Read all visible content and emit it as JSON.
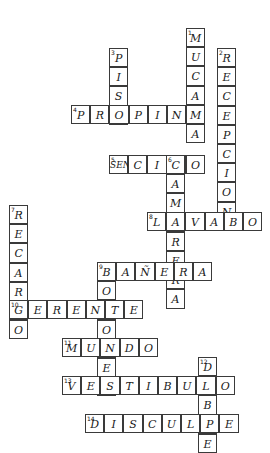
{
  "puzzle": {
    "type": "crossword",
    "title": "Crucigrama",
    "language": "es",
    "grid": {
      "cell_size": 19.2,
      "origin_x": 5,
      "origin_y": 28,
      "columns": 13,
      "rows": 21,
      "background": "#ffffff",
      "line_color": "#3a3a3a",
      "ink_color": "#1a1a1a"
    },
    "entries": [
      {
        "number": "1",
        "answer": "MUCAMA",
        "direction": "down",
        "col": 9,
        "row": 0,
        "length": 6
      },
      {
        "number": "2",
        "answer": "RECEPCION",
        "direction": "down",
        "col": 11,
        "row": 1,
        "length": 9
      },
      {
        "number": "3",
        "answer": "PISO",
        "direction": "down",
        "col": 5,
        "row": 2,
        "length": 4
      },
      {
        "number": "4",
        "answer": "PROPINA",
        "direction": "across",
        "col": 3,
        "row": 5,
        "length": 7
      },
      {
        "number": "5",
        "answer": "SENCILLO",
        "direction": "across",
        "col": 5,
        "row": 8,
        "length": 7
      },
      {
        "number": "6",
        "answer": "CAMARERA",
        "direction": "down",
        "col": 8,
        "row": 8,
        "length": 8
      },
      {
        "number": "7",
        "answer": "RECARGO",
        "direction": "down",
        "col": 0,
        "row": 11,
        "length": 7
      },
      {
        "number": "8",
        "answer": "LAVABO",
        "direction": "across",
        "col": 7,
        "row": 11,
        "length": 6
      },
      {
        "number": "9",
        "answer": "BOTONES",
        "direction": "down",
        "col": 4,
        "row": 14,
        "length": 7
      },
      {
        "number": "9",
        "answer": "BANERA",
        "direction": "across",
        "col": 4,
        "row": 14,
        "length": 6
      },
      {
        "number": "10",
        "answer": "GERENTE",
        "direction": "across",
        "col": 0,
        "row": 16,
        "length": 7
      },
      {
        "number": "11",
        "answer": "MUNDO",
        "direction": "across",
        "col": 3,
        "row": 18,
        "length": 5
      },
      {
        "number": "12",
        "answer": "DOBLE",
        "direction": "down",
        "col": 10,
        "row": 19,
        "length": 5
      },
      {
        "number": "13",
        "answer": "VESTIBULO",
        "direction": "across",
        "col": 2,
        "row": 20,
        "length": 9
      },
      {
        "number": "14",
        "answer": "DISCULPE",
        "direction": "across",
        "col": 3,
        "row": 22,
        "length": 8
      }
    ],
    "cells": [
      {
        "id": "c1",
        "x": 186,
        "y": 28,
        "letter": "M",
        "number": "1",
        "size": 1
      },
      {
        "id": "c2",
        "x": 186,
        "y": 48,
        "letter": "U",
        "number": "",
        "size": 1
      },
      {
        "id": "c3",
        "x": 186,
        "y": 67,
        "letter": "C",
        "number": "",
        "size": 1
      },
      {
        "id": "c4",
        "x": 186,
        "y": 86,
        "letter": "A",
        "number": "",
        "size": 1
      },
      {
        "id": "c5",
        "x": 186,
        "y": 105,
        "letter": "M",
        "number": "",
        "size": 1
      },
      {
        "id": "c6",
        "x": 217,
        "y": 48,
        "letter": "R",
        "number": "2",
        "size": 1
      },
      {
        "id": "c7",
        "x": 217,
        "y": 67,
        "letter": "E",
        "number": "",
        "size": 1
      },
      {
        "id": "c8",
        "x": 217,
        "y": 86,
        "letter": "C",
        "number": "",
        "size": 1
      },
      {
        "id": "c9",
        "x": 217,
        "y": 105,
        "letter": "E",
        "number": "",
        "size": 1
      },
      {
        "id": "c10",
        "x": 217,
        "y": 124,
        "letter": "P",
        "number": "",
        "size": 1
      },
      {
        "id": "c11",
        "x": 217,
        "y": 143,
        "letter": "C",
        "number": "",
        "size": 1
      },
      {
        "id": "c12",
        "x": 217,
        "y": 162,
        "letter": "I",
        "number": "",
        "size": 1
      },
      {
        "id": "c13",
        "x": 217,
        "y": 181,
        "letter": "N",
        "number": "",
        "size": 1
      },
      {
        "id": "c14",
        "x": 109,
        "y": 48,
        "letter": "P",
        "number": "3",
        "size": 1
      },
      {
        "id": "c15",
        "x": 109,
        "y": 67,
        "letter": "I",
        "number": "",
        "size": 1
      },
      {
        "id": "c16",
        "x": 109,
        "y": 86,
        "letter": "S",
        "number": "",
        "size": 1
      },
      {
        "id": "c17",
        "x": 71,
        "y": 105,
        "letter": "P",
        "number": "4",
        "size": 1
      },
      {
        "id": "c18",
        "x": 90,
        "y": 105,
        "letter": "R",
        "number": "",
        "size": 1
      },
      {
        "id": "c19",
        "x": 109,
        "y": 105,
        "letter": "O",
        "number": "",
        "size": 1
      },
      {
        "id": "c20",
        "x": 128,
        "y": 105,
        "letter": "P",
        "number": "",
        "size": 1
      },
      {
        "id": "c21",
        "x": 147,
        "y": 105,
        "letter": "I",
        "number": "",
        "size": 1
      },
      {
        "id": "c22",
        "x": 166,
        "y": 105,
        "letter": "N",
        "number": "",
        "size": 1
      },
      {
        "id": "c23",
        "x": 186,
        "y": 124,
        "letter": "A",
        "number": "",
        "size": 1
      },
      {
        "id": "c24",
        "x": 109,
        "y": 155,
        "letter": "S",
        "number": "5",
        "size": 1
      },
      {
        "id": "c25",
        "x": 128,
        "y": 155,
        "letter": "E",
        "number": "",
        "size": 1
      },
      {
        "id": "c26",
        "x": 147,
        "y": 155,
        "letter": "N",
        "number": "",
        "size": 1
      },
      {
        "id": "c27",
        "x": 166,
        "y": 155,
        "letter": "C",
        "number": "6",
        "size": 1
      },
      {
        "id": "c28",
        "x": 186,
        "y": 155,
        "letter": "I",
        "number": "",
        "size": 1
      },
      {
        "id": "c29",
        "x": 198,
        "y": 155,
        "letter": "LL",
        "number": "",
        "size": 2
      },
      {
        "id": "c30",
        "x": 217,
        "y": 200,
        "letter": "O",
        "number": "",
        "size": 1
      },
      {
        "id": "c31",
        "x": 166,
        "y": 174,
        "letter": "A",
        "number": "",
        "size": 1
      },
      {
        "id": "c32",
        "x": 166,
        "y": 193,
        "letter": "M",
        "number": "",
        "size": 1
      },
      {
        "id": "c33",
        "x": 166,
        "y": 212,
        "letter": "A",
        "number": "",
        "size": 1
      },
      {
        "id": "c34",
        "x": 166,
        "y": 231,
        "letter": "R",
        "number": "",
        "size": 1
      },
      {
        "id": "c35",
        "x": 166,
        "y": 250,
        "letter": "E",
        "number": "",
        "size": 1
      },
      {
        "id": "c36",
        "x": 166,
        "y": 269,
        "letter": "R",
        "number": "",
        "size": 1
      },
      {
        "id": "c37",
        "x": 166,
        "y": 288,
        "letter": "A",
        "number": "",
        "size": 1
      },
      {
        "id": "c38",
        "x": 147,
        "y": 212,
        "letter": "L",
        "number": "8",
        "size": 1
      },
      {
        "id": "c39",
        "x": 186,
        "y": 212,
        "letter": "V",
        "number": "",
        "size": 1
      },
      {
        "id": "c40",
        "x": 205,
        "y": 212,
        "letter": "A",
        "number": "",
        "size": 1
      },
      {
        "id": "c41",
        "x": 224,
        "y": 212,
        "letter": "B",
        "number": "",
        "size": 1
      },
      {
        "id": "c42",
        "x": 243,
        "y": 212,
        "letter": "O",
        "number": "",
        "size": 1
      },
      {
        "id": "c43",
        "x": 9,
        "y": 205,
        "letter": "R",
        "number": "7",
        "size": 1
      },
      {
        "id": "c44",
        "x": 9,
        "y": 224,
        "letter": "E",
        "number": "",
        "size": 1
      },
      {
        "id": "c45",
        "x": 9,
        "y": 243,
        "letter": "C",
        "number": "",
        "size": 1
      },
      {
        "id": "c46",
        "x": 9,
        "y": 262,
        "letter": "A",
        "number": "",
        "size": 1
      },
      {
        "id": "c47",
        "x": 9,
        "y": 281,
        "letter": "R",
        "number": "",
        "size": 1
      },
      {
        "id": "c48",
        "x": 9,
        "y": 319,
        "letter": "O",
        "number": "",
        "size": 1
      },
      {
        "id": "c49",
        "x": 97,
        "y": 262,
        "letter": "B",
        "number": "9",
        "size": 1
      },
      {
        "id": "c50",
        "x": 116,
        "y": 262,
        "letter": "A",
        "number": "",
        "size": 1
      },
      {
        "id": "c51",
        "x": 135,
        "y": 262,
        "letter": "Ñ",
        "number": "",
        "size": 1
      },
      {
        "id": "c52",
        "x": 147,
        "y": 262,
        "letter": "E",
        "number": "",
        "size": 1
      },
      {
        "id": "c53",
        "x": 97,
        "y": 281,
        "letter": "O",
        "number": "",
        "size": 1
      },
      {
        "id": "c54",
        "x": 97,
        "y": 319,
        "letter": "O",
        "number": "",
        "size": 1
      },
      {
        "id": "c55",
        "x": 97,
        "y": 357,
        "letter": "E",
        "number": "",
        "size": 1
      },
      {
        "id": "c56",
        "x": 9,
        "y": 300,
        "letter": "G",
        "number": "10",
        "size": 1
      },
      {
        "id": "c57",
        "x": 28,
        "y": 300,
        "letter": "E",
        "number": "",
        "size": 1
      },
      {
        "id": "c58",
        "x": 47,
        "y": 300,
        "letter": "R",
        "number": "",
        "size": 1
      },
      {
        "id": "c59",
        "x": 66,
        "y": 300,
        "letter": "E",
        "number": "",
        "size": 1
      },
      {
        "id": "c60",
        "x": 85,
        "y": 300,
        "letter": "N",
        "number": "",
        "size": 1
      },
      {
        "id": "c61",
        "x": 97,
        "y": 300,
        "letter": "T",
        "number": "",
        "size": 1
      },
      {
        "id": "c62",
        "x": 116,
        "y": 300,
        "letter": "E",
        "number": "",
        "size": 1
      },
      {
        "id": "c63",
        "x": 62,
        "y": 338,
        "letter": "M",
        "number": "11",
        "size": 1
      },
      {
        "id": "c64",
        "x": 81,
        "y": 338,
        "letter": "U",
        "number": "",
        "size": 1
      },
      {
        "id": "c65",
        "x": 97,
        "y": 338,
        "letter": "N",
        "number": "",
        "size": 1
      },
      {
        "id": "c66",
        "x": 116,
        "y": 338,
        "letter": "D",
        "number": "",
        "size": 1
      },
      {
        "id": "c67",
        "x": 135,
        "y": 338,
        "letter": "O",
        "number": "",
        "size": 1
      },
      {
        "id": "c68",
        "x": 198,
        "y": 357,
        "letter": "D",
        "number": "12",
        "size": 1
      },
      {
        "id": "c69",
        "x": 198,
        "y": 395,
        "letter": "B",
        "number": "",
        "size": 1
      },
      {
        "id": "c70",
        "x": 198,
        "y": 414,
        "letter": "L",
        "number": "",
        "size": 1
      },
      {
        "id": "c71",
        "x": 62,
        "y": 376,
        "letter": "V",
        "number": "13",
        "size": 1
      },
      {
        "id": "c72",
        "x": 81,
        "y": 376,
        "letter": "E",
        "number": "",
        "size": 1
      },
      {
        "id": "c73",
        "x": 97,
        "y": 376,
        "letter": "S",
        "number": "",
        "size": 1
      },
      {
        "id": "c74",
        "x": 116,
        "y": 376,
        "letter": "T",
        "number": "",
        "size": 1
      },
      {
        "id": "c75",
        "x": 135,
        "y": 376,
        "letter": "I",
        "number": "",
        "size": 1
      },
      {
        "id": "c76",
        "x": 154,
        "y": 376,
        "letter": "B",
        "number": "",
        "size": 1
      },
      {
        "id": "c77",
        "x": 173,
        "y": 376,
        "letter": "U",
        "number": "",
        "size": 1
      },
      {
        "id": "c78",
        "x": 186,
        "y": 376,
        "letter": "L",
        "number": "",
        "size": 1
      },
      {
        "id": "c79",
        "x": 198,
        "y": 376,
        "letter": "O",
        "number": "",
        "size": 1
      },
      {
        "id": "c80",
        "x": 85,
        "y": 414,
        "letter": "D",
        "number": "14",
        "size": 1
      },
      {
        "id": "c81",
        "x": 104,
        "y": 414,
        "letter": "I",
        "number": "",
        "size": 1
      },
      {
        "id": "c82",
        "x": 123,
        "y": 414,
        "letter": "S",
        "number": "",
        "size": 1
      },
      {
        "id": "c83",
        "x": 142,
        "y": 414,
        "letter": "C",
        "number": "",
        "size": 1
      },
      {
        "id": "c84",
        "x": 161,
        "y": 414,
        "letter": "U",
        "number": "",
        "size": 1
      },
      {
        "id": "c85",
        "x": 180,
        "y": 414,
        "letter": "L",
        "number": "",
        "size": 1
      },
      {
        "id": "c86",
        "x": 198,
        "y": 414,
        "letter": "P",
        "number": "",
        "size": 1
      },
      {
        "id": "c87",
        "x": 217,
        "y": 414,
        "letter": "E",
        "number": "",
        "size": 1
      }
    ]
  }
}
